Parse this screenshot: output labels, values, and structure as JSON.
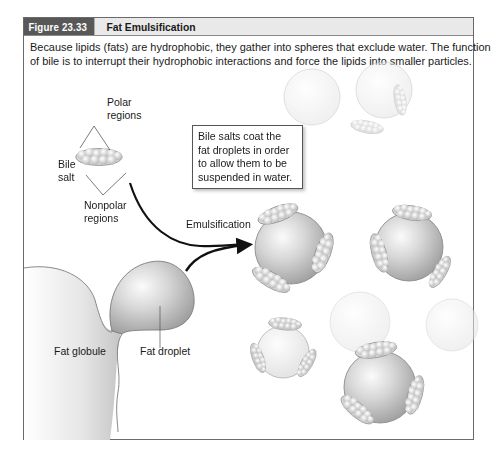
{
  "figure": {
    "number": "Figure 23.33",
    "title": "Fat Emulsification",
    "caption_lines": [
      "Because lipids (fats) are hydrophobic, they gather into spheres that exclude water. The function",
      "of bile is to interrupt their hydrophobic interactions and force the lipids into smaller particles."
    ]
  },
  "labels": {
    "polar_regions": [
      "Polar",
      "regions"
    ],
    "bile_salt": [
      "Bile",
      "salt"
    ],
    "nonpolar_regions": [
      "Nonpolar",
      "regions"
    ],
    "emulsification": "Emulsification",
    "fat_globule": "Fat globule",
    "fat_droplet": "Fat droplet"
  },
  "callout": {
    "lines": [
      "Bile salts coat the",
      "fat droplets in order",
      "to allow them to be",
      "suspended in water."
    ]
  },
  "colors": {
    "title_dark": "#585858",
    "title_light": "#e9e9e9",
    "border": "#6a6a6a",
    "sphere": "#c8c8c8",
    "arrow": "#111111"
  }
}
